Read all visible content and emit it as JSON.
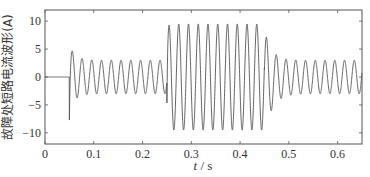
{
  "chart_data": {
    "type": "line",
    "title": "",
    "xlabel_var": "t",
    "xlabel_unit": "s",
    "xlabel": "t / s",
    "ylabel": "故障处短路电流波形(A)",
    "xlim": [
      0,
      0.65
    ],
    "ylim": [
      -12,
      12
    ],
    "xticks": [
      0,
      0.1,
      0.2,
      0.3,
      0.4,
      0.5,
      0.6
    ],
    "xtick_labels": [
      "0",
      "0.1",
      "0.2",
      "0.3",
      "0.4",
      "0.5",
      "0.6"
    ],
    "yticks": [
      10,
      5,
      0,
      -5,
      -10
    ],
    "ytick_labels": [
      "10",
      "5",
      "0",
      "−10",
      "−5"
    ],
    "grid": false,
    "legend": null,
    "line_color": "#555555",
    "frequency_hz": 50,
    "segments": [
      {
        "t_start": 0.0,
        "t_end": 0.05,
        "description": "pre-fault",
        "amplitude": 0
      },
      {
        "t_start": 0.05,
        "t_end": 0.25,
        "description": "fault current with decaying transient",
        "initial_min": -6.5,
        "initial_peak": 6.0,
        "steady_amplitude": 3.0
      },
      {
        "t_start": 0.25,
        "t_end": 0.45,
        "description": "high-amplitude segment",
        "amplitude": 9.5,
        "initial_min": -7.5
      },
      {
        "t_start": 0.45,
        "t_end": 0.65,
        "description": "return to fault current with decay",
        "initial_peak": 7.0,
        "steady_amplitude": 3.0
      }
    ]
  }
}
